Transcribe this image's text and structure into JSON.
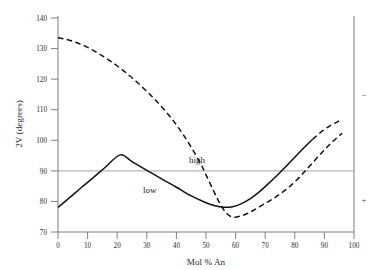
{
  "chart_data": {
    "type": "line",
    "title": "",
    "xlabel": "Mol % An",
    "ylabel": "2V (degrees)",
    "xlim": [
      0,
      100
    ],
    "ylim": [
      70,
      140
    ],
    "xticks": [
      0,
      10,
      20,
      30,
      40,
      50,
      60,
      70,
      80,
      90,
      100
    ],
    "xtick_labels": [
      "0",
      "10",
      "20",
      "30",
      "40",
      "50",
      "60",
      "70",
      "80",
      "90",
      "100"
    ],
    "yticks": [
      70,
      80,
      90,
      100,
      110,
      120,
      130,
      140
    ],
    "ytick_labels": [
      "70",
      "80",
      "90",
      "100",
      "110",
      "120",
      "130",
      "140"
    ],
    "grid": false,
    "legend_position": "inline-annotation",
    "reference_lines": [
      {
        "name": "ninety-degree-line",
        "orientation": "horizontal",
        "value": 90,
        "color": "#8c8c8c"
      }
    ],
    "annotations": [
      {
        "name": "high-label",
        "text": "high",
        "x": 44,
        "y": 95
      },
      {
        "name": "low-label",
        "text": "low",
        "x": 29,
        "y": 85
      },
      {
        "name": "optic-sign-negative",
        "text": "−",
        "x": 104,
        "y": 118
      },
      {
        "name": "optic-sign-positive",
        "text": "+",
        "x": 104,
        "y": 81
      }
    ],
    "series": [
      {
        "name": "high",
        "label": "high",
        "style": "dashed",
        "color": "#111111",
        "points": [
          [
            0,
            133.0
          ],
          [
            3,
            132.4
          ],
          [
            6,
            131.5
          ],
          [
            9,
            130.3
          ],
          [
            12,
            128.8
          ],
          [
            15,
            127.1
          ],
          [
            18,
            125.2
          ],
          [
            21,
            123.1
          ],
          [
            24,
            120.8
          ],
          [
            27,
            118.3
          ],
          [
            30,
            115.6
          ],
          [
            33,
            112.7
          ],
          [
            36,
            109.5
          ],
          [
            39,
            106.0
          ],
          [
            42,
            102.0
          ],
          [
            45,
            97.5
          ],
          [
            48,
            92.5
          ],
          [
            50,
            88.5
          ],
          [
            52,
            84.5
          ],
          [
            54,
            80.5
          ],
          [
            56,
            77.2
          ],
          [
            58,
            75.2
          ],
          [
            60,
            74.8
          ],
          [
            63,
            75.6
          ],
          [
            66,
            77.0
          ],
          [
            69,
            78.7
          ],
          [
            72,
            80.4
          ],
          [
            75,
            82.3
          ],
          [
            78,
            84.5
          ],
          [
            81,
            87.2
          ],
          [
            84,
            90.3
          ],
          [
            87,
            93.5
          ],
          [
            90,
            96.6
          ],
          [
            93,
            99.5
          ],
          [
            96,
            102.0
          ]
        ]
      },
      {
        "name": "low",
        "label": "low",
        "style": "solid-then-dashed",
        "dash_start_x": 88,
        "color": "#111111",
        "points": [
          [
            0,
            78.0
          ],
          [
            4,
            81.2
          ],
          [
            8,
            84.5
          ],
          [
            12,
            87.7
          ],
          [
            16,
            91.0
          ],
          [
            21,
            95.0
          ],
          [
            25,
            92.8
          ],
          [
            30,
            90.0
          ],
          [
            35,
            87.2
          ],
          [
            40,
            84.5
          ],
          [
            45,
            81.7
          ],
          [
            50,
            79.5
          ],
          [
            53,
            78.5
          ],
          [
            56,
            78.0
          ],
          [
            59,
            78.2
          ],
          [
            62,
            79.2
          ],
          [
            65,
            80.8
          ],
          [
            68,
            83.0
          ],
          [
            71,
            85.6
          ],
          [
            74,
            88.3
          ],
          [
            77,
            91.2
          ],
          [
            80,
            94.2
          ],
          [
            83,
            97.2
          ],
          [
            86,
            100.0
          ],
          [
            89,
            102.5
          ],
          [
            92,
            104.5
          ],
          [
            95,
            106.0
          ]
        ]
      }
    ]
  },
  "axes": {
    "y_axis_title": "2V (degrees)",
    "x_axis_title": "Mol % An"
  }
}
